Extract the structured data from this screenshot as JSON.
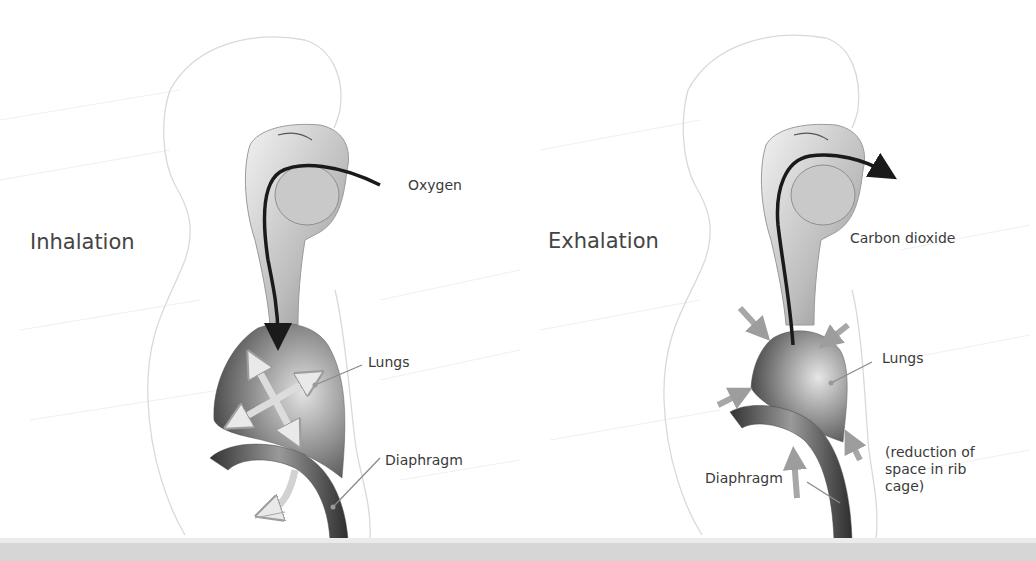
{
  "figure": {
    "panels": [
      {
        "id": "inhalation",
        "title": "Inhalation",
        "labels": {
          "gas": "Oxygen",
          "lungs": "Lungs",
          "diaphragm": "Diaphragm"
        }
      },
      {
        "id": "exhalation",
        "title": "Exhalation",
        "labels": {
          "gas": "Carbon dioxide",
          "lungs": "Lungs",
          "diaphragm": "Diaphragm",
          "note": "(reduction of\nspace in rib\ncage)"
        }
      }
    ],
    "colors": {
      "text": "#3a3a3a",
      "airflow_arrow": "#1a1a1a",
      "lung_dark": "#4a4a4a",
      "lung_light": "#d0d0d0",
      "diaphragm": "#555555",
      "motion_arrow": "#b5b5b5",
      "bottom_band": "#d6d6d6"
    }
  }
}
